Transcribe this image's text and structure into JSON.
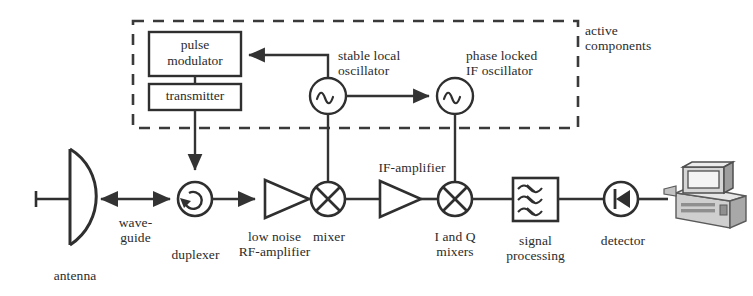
{
  "diagram": {
    "group_box": {
      "label": "active\ncomponents",
      "style": "dashed",
      "name": "active-components-group"
    },
    "blocks": [
      {
        "id": "pulse_modulator",
        "label": "pulse\nmodulator",
        "shape": "rectangle"
      },
      {
        "id": "transmitter",
        "label": "transmitter",
        "shape": "rectangle"
      },
      {
        "id": "stable_local_oscillator",
        "label": "stable local\noscillator",
        "shape": "oscillator-circle"
      },
      {
        "id": "phase_locked_if_oscillator",
        "label": "phase locked\nIF oscillator",
        "shape": "oscillator-circle"
      },
      {
        "id": "antenna",
        "label": "antenna",
        "shape": "parabolic-dish"
      },
      {
        "id": "waveguide",
        "label": "wave-\nguide",
        "shape": "bidirectional-link"
      },
      {
        "id": "duplexer",
        "label": "duplexer",
        "shape": "circulator-circle"
      },
      {
        "id": "low_noise_rf_amplifier",
        "label": "low noise\nRF-amplifier",
        "shape": "triangle-amplifier"
      },
      {
        "id": "mixer",
        "label": "mixer",
        "shape": "mixer-circle-x"
      },
      {
        "id": "if_amplifier",
        "label": "IF-amplifier",
        "shape": "triangle-amplifier"
      },
      {
        "id": "i_and_q_mixers",
        "label": "I and Q\nmixers",
        "shape": "mixer-circle-x"
      },
      {
        "id": "signal_processing",
        "label": "signal\nprocessing",
        "shape": "filter-box-waves"
      },
      {
        "id": "detector",
        "label": "detector",
        "shape": "diode-circle"
      },
      {
        "id": "computer",
        "label": "",
        "shape": "computer-workstation"
      }
    ],
    "colors": {
      "ink": "#2b2b2b",
      "line": "#3a3a3a",
      "background": "#ffffff",
      "computer_fill": "#b9b9b9",
      "computer_shade": "#8e8e8e"
    }
  }
}
